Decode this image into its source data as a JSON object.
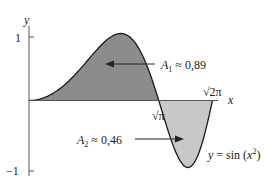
{
  "chart_data": {
    "type": "area",
    "title": "",
    "function_label": "y = sin (x²)",
    "xlabel": "x",
    "ylabel": "y",
    "xlim": [
      0,
      2.5066
    ],
    "ylim": [
      -1,
      1
    ],
    "y_ticks": [
      {
        "value": 1,
        "label": "1"
      },
      {
        "value": -1,
        "label": "−1"
      }
    ],
    "x_marks": [
      {
        "value": 1.7725,
        "label": "√π"
      },
      {
        "value": 2.5066,
        "label": "√2π"
      }
    ],
    "regions": [
      {
        "name": "A1",
        "label": "A₁ ≈ 0,89",
        "value": 0.89,
        "from": 0,
        "to": 1.7725,
        "color": "#8c8c8c"
      },
      {
        "name": "A2",
        "label": "A₂ ≈ 0,46",
        "value": 0.46,
        "from": 1.7725,
        "to": 2.5066,
        "color": "#c8c8c8"
      }
    ],
    "grid": false
  },
  "labels": {
    "y_axis": "y",
    "x_axis": "x",
    "tick_1": "1",
    "tick_neg1": "−1",
    "sqrt_pi": "√π",
    "sqrt_2pi": "√2π",
    "a1_name": "A",
    "a1_sub": "1",
    "a1_value": " ≈ 0,89",
    "a2_name": "A",
    "a2_sub": "2",
    "a2_value": " ≈ 0,46",
    "func_y": "y",
    "func_eq": " = sin (",
    "func_x": "x",
    "func_exp": "2",
    "func_close": ")"
  },
  "colors": {
    "region1": "#8c8c8c",
    "region2": "#c8c8c8",
    "curve": "#1a1a1a",
    "axis": "#555555"
  }
}
